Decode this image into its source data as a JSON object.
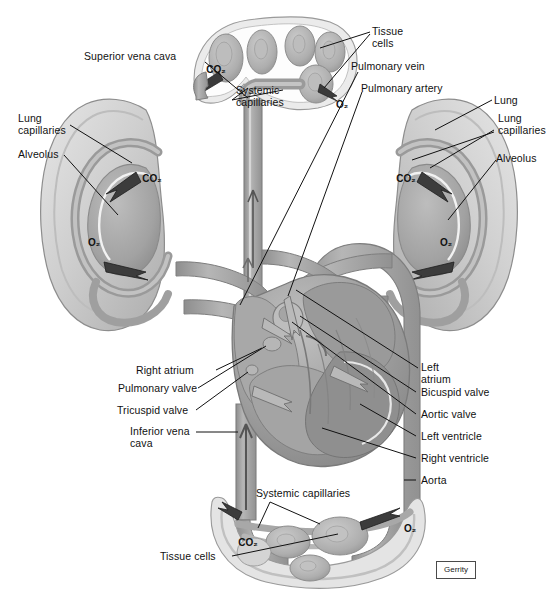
{
  "figure": {
    "signature": "Gerrity",
    "background_color": "#ffffff",
    "ink_color": "#111111",
    "tissue_fill_light": "#d8d8d8",
    "tissue_fill_mid": "#b3b3b3",
    "tissue_fill_dark": "#8f8f8f",
    "vessel_fill": "#a9a9a9",
    "heart_fill": "#9c9c9c"
  },
  "labels": {
    "superior_vena_cava": "Superior vena cava",
    "lung_capillaries_left": "Lung\ncapillaries",
    "alveolus_left": "Alveolus",
    "systemic_capillaries_top": "Systemic\ncapillaries",
    "tissue_cells_top": "Tissue\ncells",
    "pulmonary_vein": "Pulmonary vein",
    "pulmonary_artery": "Pulmonary artery",
    "lung_right": "Lung",
    "lung_capillaries_right": "Lung\ncapillaries",
    "alveolus_right": "Alveolus",
    "right_atrium": "Right atrium",
    "pulmonary_valve": "Pulmonary valve",
    "tricuspid_valve": "Tricuspid valve",
    "inferior_vena_cava": "Inferior vena\ncava",
    "left_atrium": "Left\natrium",
    "bicuspid_valve": "Bicuspid valve",
    "aortic_valve": "Aortic valve",
    "left_ventricle": "Left ventricle",
    "right_ventricle": "Right ventricle",
    "aorta": "Aorta",
    "systemic_capillaries_bottom": "Systemic capillaries",
    "tissue_cells_bottom": "Tissue cells"
  },
  "gas_markers": {
    "co2": "CO₂",
    "o2": "O₂",
    "top_capillary_co2": "CO₂",
    "top_capillary_o2": "O₂",
    "left_lung_co2": "CO₂",
    "left_lung_o2": "O₂",
    "right_lung_co2": "CO₂",
    "right_lung_o2": "O₂",
    "bottom_capillary_co2": "CO₂",
    "bottom_capillary_o2": "O₂"
  }
}
